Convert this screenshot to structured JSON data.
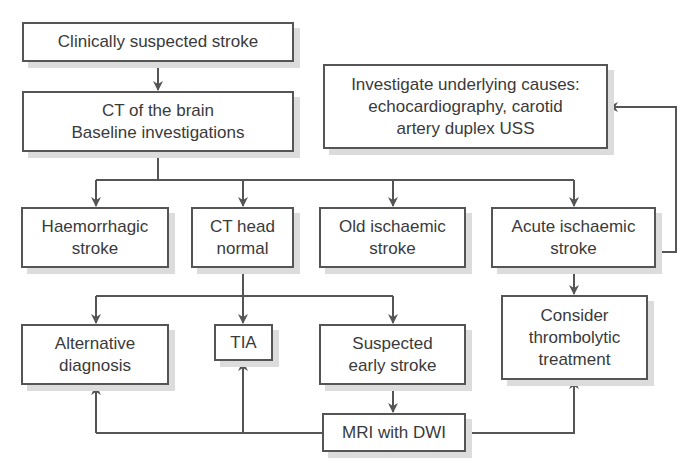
{
  "diagram": {
    "colors": {
      "line": "#555555",
      "box_border": "#555555",
      "shadow": "#dcdcdc",
      "text": "#3a3a3a",
      "background": "#ffffff"
    },
    "nodes": {
      "suspected": {
        "label": "Clinically suspected stroke"
      },
      "ct_brain": {
        "label": "CT of the brain\nBaseline investigations"
      },
      "investigate": {
        "label": "Investigate underlying causes:\nechocardiography, carotid\nartery duplex USS"
      },
      "haemorrhagic": {
        "label": "Haemorrhagic\nstroke"
      },
      "ct_normal": {
        "label": "CT head\nnormal"
      },
      "old_ischaemic": {
        "label": "Old ischaemic\nstroke"
      },
      "acute_ischaemic": {
        "label": "Acute ischaemic\nstroke"
      },
      "alternative": {
        "label": "Alternative\ndiagnosis"
      },
      "tia": {
        "label": "TIA"
      },
      "suspected_early": {
        "label": "Suspected\nearly stroke"
      },
      "thrombolytic": {
        "label": "Consider\nthrombolytic\ntreatment"
      },
      "mri": {
        "label": "MRI with DWI"
      }
    },
    "edges": [
      {
        "from": "suspected",
        "to": "ct_brain"
      },
      {
        "from": "ct_brain",
        "to": "haemorrhagic"
      },
      {
        "from": "ct_brain",
        "to": "ct_normal"
      },
      {
        "from": "ct_brain",
        "to": "old_ischaemic"
      },
      {
        "from": "ct_brain",
        "to": "acute_ischaemic"
      },
      {
        "from": "acute_ischaemic",
        "to": "investigate"
      },
      {
        "from": "acute_ischaemic",
        "to": "thrombolytic"
      },
      {
        "from": "ct_normal",
        "to": "alternative"
      },
      {
        "from": "ct_normal",
        "to": "tia"
      },
      {
        "from": "ct_normal",
        "to": "suspected_early"
      },
      {
        "from": "suspected_early",
        "to": "mri"
      },
      {
        "from": "mri",
        "to": "alternative"
      },
      {
        "from": "mri",
        "to": "tia"
      },
      {
        "from": "mri",
        "to": "thrombolytic"
      }
    ]
  }
}
